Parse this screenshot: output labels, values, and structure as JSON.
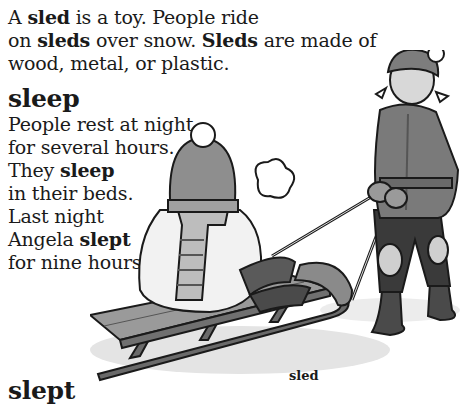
{
  "entries": {
    "sled": {
      "definition": [
        [
          {
            "t": "A "
          },
          {
            "t": "sled",
            "b": true
          },
          {
            "t": " is a toy.  People ride"
          }
        ],
        [
          {
            "t": "on "
          },
          {
            "t": "sleds",
            "b": true
          },
          {
            "t": " over snow.  "
          },
          {
            "t": "Sleds",
            "b": true
          },
          {
            "t": " are made of"
          }
        ],
        [
          {
            "t": "wood, metal, or plastic."
          }
        ]
      ]
    },
    "sleep": {
      "headword": "sleep",
      "definition": [
        [
          {
            "t": "People rest at night"
          }
        ],
        [
          {
            "t": "for several hours."
          }
        ],
        [
          {
            "t": "They "
          },
          {
            "t": "sleep",
            "b": true
          }
        ],
        [
          {
            "t": "in their beds."
          }
        ],
        [
          {
            "t": "Last night"
          }
        ],
        [
          {
            "t": "Angela "
          },
          {
            "t": "slept",
            "b": true
          }
        ],
        [
          {
            "t": "for nine hours."
          }
        ]
      ]
    },
    "slept": {
      "headword": "slept"
    }
  },
  "illustration": {
    "subject": "child-on-sled-pulled-by-girl",
    "caption": "sled"
  },
  "colors": {
    "ink": "#1a1a1a",
    "paper": "#ffffff",
    "shade_dark": "#5a5a5a",
    "shade_mid": "#8c8c8c",
    "shade_light": "#c8c8c8"
  }
}
